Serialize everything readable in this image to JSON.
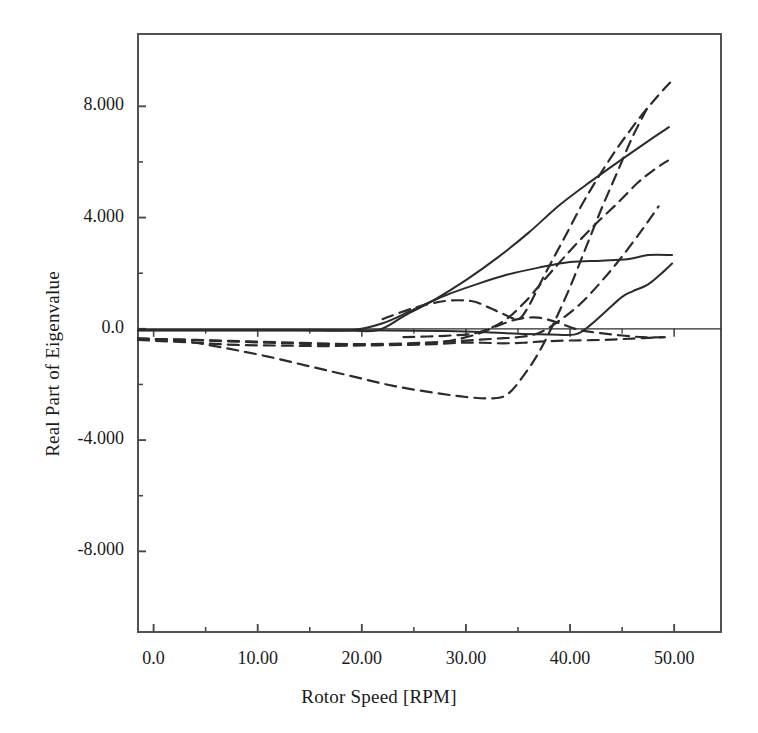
{
  "chart_data": {
    "type": "line",
    "title": "",
    "xlabel": "Rotor Speed [RPM]",
    "ylabel": "Real Part of Eigenvalue",
    "xlim": [
      -1.5,
      54.5
    ],
    "ylim": [
      -10.9,
      10.6
    ],
    "xticks": [
      0,
      10,
      20,
      30,
      40,
      50
    ],
    "xtick_labels": [
      "0.0",
      "10.00",
      "20.00",
      "30.00",
      "40.00",
      "50.00"
    ],
    "yticks": [
      -8,
      -4,
      0,
      4,
      8
    ],
    "ytick_labels": [
      "-8.000",
      "-4.000",
      "0.0",
      "4.000",
      "8.000"
    ],
    "minor_xticks": [
      5,
      15,
      25,
      35,
      45
    ],
    "minor_yticks": [
      -6,
      -2,
      2,
      6
    ],
    "grid": false,
    "legend": null,
    "zero_line": true,
    "line_color": "#2b2b2b",
    "frame_color": "#4a4a4a",
    "background": "#ffffff",
    "series": [
      {
        "name": "mode-1-solid-rising-steep",
        "style": "solid",
        "points": [
          [
            -1.5,
            -0.05
          ],
          [
            5,
            -0.05
          ],
          [
            12,
            -0.05
          ],
          [
            18,
            -0.05
          ],
          [
            21.5,
            -0.05
          ],
          [
            24,
            0.45
          ],
          [
            27,
            1.05
          ],
          [
            30,
            1.75
          ],
          [
            33,
            2.55
          ],
          [
            36,
            3.45
          ],
          [
            39,
            4.45
          ],
          [
            42,
            5.3
          ],
          [
            45,
            6.1
          ],
          [
            47.5,
            6.75
          ],
          [
            49.5,
            7.25
          ]
        ]
      },
      {
        "name": "mode-2-solid-arch-upper",
        "style": "solid",
        "points": [
          [
            -1.5,
            -0.05
          ],
          [
            6,
            -0.05
          ],
          [
            14,
            -0.05
          ],
          [
            19,
            -0.05
          ],
          [
            22,
            0.2
          ],
          [
            25,
            0.7
          ],
          [
            28,
            1.2
          ],
          [
            31,
            1.6
          ],
          [
            34,
            1.95
          ],
          [
            37,
            2.2
          ],
          [
            40,
            2.4
          ],
          [
            43,
            2.45
          ],
          [
            45.5,
            2.5
          ],
          [
            47.5,
            2.65
          ],
          [
            49.8,
            2.65
          ]
        ]
      },
      {
        "name": "mode-3-solid-lower-rising",
        "style": "solid",
        "points": [
          [
            -1.5,
            -0.05
          ],
          [
            10,
            -0.05
          ],
          [
            20,
            -0.05
          ],
          [
            28,
            -0.08
          ],
          [
            32,
            -0.12
          ],
          [
            35,
            -0.18
          ],
          [
            38,
            -0.2
          ],
          [
            40.5,
            -0.2
          ],
          [
            42,
            0.15
          ],
          [
            43.5,
            0.65
          ],
          [
            45,
            1.15
          ],
          [
            46,
            1.35
          ],
          [
            47.5,
            1.6
          ],
          [
            48.8,
            2.0
          ],
          [
            49.8,
            2.35
          ]
        ]
      },
      {
        "name": "mode-4-dashed-steepest",
        "style": "dashed",
        "points": [
          [
            22,
            0.35
          ],
          [
            25,
            0.75
          ],
          [
            28,
            1.0
          ],
          [
            30.5,
            1.0
          ],
          [
            32,
            0.8
          ],
          [
            33.5,
            0.55
          ],
          [
            35,
            0.35
          ],
          [
            36,
            0.8
          ],
          [
            37.5,
            1.9
          ],
          [
            39.5,
            3.3
          ],
          [
            41.5,
            4.7
          ],
          [
            44,
            6.2
          ],
          [
            46.5,
            7.5
          ],
          [
            48.5,
            8.4
          ],
          [
            49.6,
            8.85
          ]
        ]
      },
      {
        "name": "mode-5-dashed-second-steep",
        "style": "dashed",
        "points": [
          [
            24,
            -0.3
          ],
          [
            28,
            -0.25
          ],
          [
            31,
            -0.15
          ],
          [
            33.5,
            0.25
          ],
          [
            35.5,
            0.9
          ],
          [
            37.5,
            1.75
          ],
          [
            39.5,
            2.6
          ],
          [
            42,
            3.6
          ],
          [
            44.5,
            4.5
          ],
          [
            46.5,
            5.25
          ],
          [
            48,
            5.7
          ],
          [
            49.4,
            6.05
          ]
        ]
      },
      {
        "name": "mode-6-dashed-deep-dip",
        "style": "dashed",
        "points": [
          [
            -1.5,
            -0.35
          ],
          [
            3,
            -0.45
          ],
          [
            7,
            -0.7
          ],
          [
            11,
            -1.0
          ],
          [
            15,
            -1.35
          ],
          [
            19,
            -1.7
          ],
          [
            23,
            -2.05
          ],
          [
            27,
            -2.3
          ],
          [
            30,
            -2.45
          ],
          [
            32.5,
            -2.5
          ],
          [
            34,
            -2.35
          ],
          [
            35.5,
            -1.7
          ],
          [
            37,
            -0.85
          ],
          [
            38.5,
            0.25
          ],
          [
            40,
            1.5
          ],
          [
            41.5,
            2.9
          ],
          [
            43,
            4.3
          ],
          [
            44.5,
            5.6
          ],
          [
            46,
            6.9
          ],
          [
            47.5,
            8.0
          ]
        ]
      },
      {
        "name": "mode-7-dashed-shallow-flat",
        "style": "dashed",
        "points": [
          [
            -1.5,
            -0.35
          ],
          [
            4,
            -0.4
          ],
          [
            9,
            -0.45
          ],
          [
            14,
            -0.5
          ],
          [
            19,
            -0.55
          ],
          [
            24,
            -0.55
          ],
          [
            28,
            -0.45
          ],
          [
            31,
            -0.2
          ],
          [
            33,
            0.1
          ],
          [
            35,
            0.35
          ],
          [
            37,
            0.4
          ],
          [
            39,
            0.2
          ],
          [
            41,
            -0.05
          ],
          [
            44,
            -0.2
          ],
          [
            47,
            -0.3
          ],
          [
            49.5,
            -0.3
          ]
        ]
      },
      {
        "name": "mode-8-dashed-flat-near-zero",
        "style": "dashed",
        "points": [
          [
            -1.5,
            -0.35
          ],
          [
            5,
            -0.42
          ],
          [
            11,
            -0.5
          ],
          [
            16,
            -0.55
          ],
          [
            21,
            -0.55
          ],
          [
            26,
            -0.5
          ],
          [
            29,
            -0.45
          ],
          [
            31,
            -0.4
          ],
          [
            33,
            -0.35
          ],
          [
            35,
            -0.3
          ],
          [
            37,
            -0.15
          ],
          [
            39,
            0.3
          ],
          [
            41,
            0.9
          ],
          [
            43,
            1.7
          ],
          [
            45,
            2.6
          ],
          [
            47,
            3.6
          ],
          [
            48.5,
            4.4
          ]
        ]
      },
      {
        "name": "mode-9-dashed-mid-band",
        "style": "dashed",
        "points": [
          [
            -1.5,
            -0.4
          ],
          [
            4,
            -0.5
          ],
          [
            8,
            -0.58
          ],
          [
            12,
            -0.6
          ],
          [
            16,
            -0.62
          ],
          [
            20,
            -0.6
          ],
          [
            24,
            -0.58
          ],
          [
            27,
            -0.55
          ],
          [
            29.5,
            -0.5
          ],
          [
            31.5,
            -0.5
          ],
          [
            33.5,
            -0.52
          ],
          [
            35.5,
            -0.5
          ],
          [
            37.5,
            -0.45
          ],
          [
            40,
            -0.42
          ],
          [
            43,
            -0.4
          ],
          [
            46,
            -0.35
          ],
          [
            49,
            -0.3
          ]
        ]
      }
    ]
  },
  "axes": {
    "x_title": "Rotor Speed [RPM]",
    "y_title": "Real Part of Eigenvalue"
  }
}
